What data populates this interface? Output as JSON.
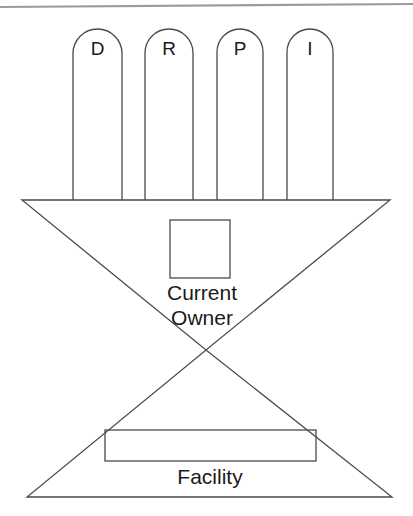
{
  "figure": {
    "background_color": "#ffffff",
    "line_color": "#3a3a3a",
    "rule_color": "#9b9b9b",
    "text_color": "#1a1a1a"
  },
  "top_rule": {
    "name": "page-top-rule",
    "x1": 0,
    "y1": 7,
    "x2": 413,
    "y2": 4
  },
  "pillars": [
    {
      "id": "pillar-d",
      "label": "D",
      "x": 73,
      "width": 49,
      "top": 29,
      "bottom": 200,
      "label_x": 97.5,
      "label_y": 50
    },
    {
      "id": "pillar-r",
      "label": "R",
      "x": 145,
      "width": 48,
      "top": 29,
      "bottom": 200,
      "label_x": 169,
      "label_y": 50
    },
    {
      "id": "pillar-p",
      "label": "P",
      "x": 217,
      "width": 46,
      "top": 29,
      "bottom": 200,
      "label_x": 240,
      "label_y": 50
    },
    {
      "id": "pillar-i",
      "label": "I",
      "x": 287,
      "width": 46,
      "top": 29,
      "bottom": 200,
      "label_x": 310,
      "label_y": 50
    }
  ],
  "upper_triangle": {
    "name": "upper-inverted-triangle",
    "left_x": 22,
    "right_x": 390,
    "top_y": 200,
    "apex_x": 206,
    "apex_y": 350
  },
  "lower_triangle": {
    "name": "lower-upright-triangle",
    "left_x": 27,
    "right_x": 392,
    "base_y": 497,
    "apex_x": 206,
    "apex_y": 350
  },
  "owner_box": {
    "name": "current-owner-box",
    "x": 170,
    "y": 220,
    "width": 60,
    "height": 58
  },
  "facility_box": {
    "name": "facility-box",
    "x": 105,
    "y": 430,
    "width": 211,
    "height": 31
  },
  "labels": {
    "current": {
      "text": "Current",
      "x": 202,
      "y": 294
    },
    "owner": {
      "text": "Owner",
      "x": 202,
      "y": 319
    },
    "facility": {
      "text": "Facility",
      "x": 210,
      "y": 478
    }
  }
}
